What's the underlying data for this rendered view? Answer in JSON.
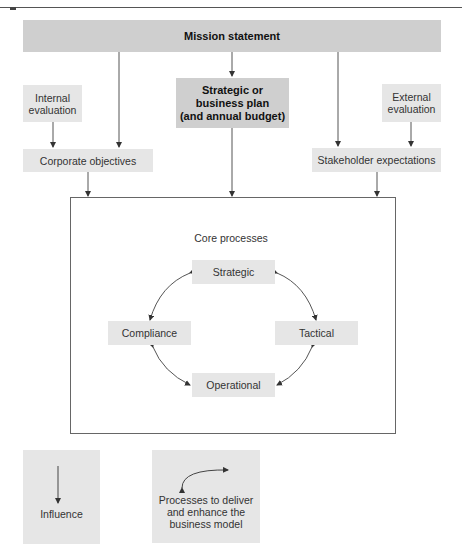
{
  "diagram": {
    "type": "flow diagram",
    "top_node": {
      "label": "Mission statement"
    },
    "plan_node": {
      "lines": [
        "Strategic or",
        "business plan",
        "(and annual budget)"
      ]
    },
    "internal_eval": {
      "lines": [
        "Internal",
        "evaluation"
      ]
    },
    "external_eval": {
      "lines": [
        "External",
        "evaluation"
      ]
    },
    "corporate_objectives": {
      "label": "Corporate objectives"
    },
    "stakeholder_expectations": {
      "label": "Stakeholder expectations"
    },
    "core": {
      "title": "Core processes",
      "nodes": [
        {
          "id": "strategic",
          "label": "Strategic"
        },
        {
          "id": "tactical",
          "label": "Tactical"
        },
        {
          "id": "operational",
          "label": "Operational"
        },
        {
          "id": "compliance",
          "label": "Compliance"
        }
      ]
    },
    "legend": {
      "influence": {
        "label": "Influence",
        "icon": "arrow-down-icon"
      },
      "process": {
        "lines": [
          "Processes to deliver",
          "and enhance the",
          "business model"
        ],
        "icon": "curved-arrow-icon"
      }
    },
    "edges": [
      {
        "from": "Mission statement",
        "to": "Strategic or business plan",
        "kind": "influence"
      },
      {
        "from": "Mission statement",
        "to": "Corporate objectives",
        "kind": "influence"
      },
      {
        "from": "Mission statement",
        "to": "Stakeholder expectations",
        "kind": "influence"
      },
      {
        "from": "Internal evaluation",
        "to": "Corporate objectives",
        "kind": "influence"
      },
      {
        "from": "External evaluation",
        "to": "Stakeholder expectations",
        "kind": "influence"
      },
      {
        "from": "Corporate objectives",
        "to": "Core processes",
        "kind": "influence"
      },
      {
        "from": "Strategic or business plan",
        "to": "Core processes",
        "kind": "influence"
      },
      {
        "from": "Stakeholder expectations",
        "to": "Core processes",
        "kind": "influence"
      },
      {
        "from": "Strategic",
        "to": "Tactical",
        "kind": "process"
      },
      {
        "from": "Tactical",
        "to": "Operational",
        "kind": "process"
      },
      {
        "from": "Operational",
        "to": "Compliance",
        "kind": "process"
      },
      {
        "from": "Compliance",
        "to": "Strategic",
        "kind": "process"
      }
    ],
    "colors": {
      "box_light": "#e6e6e6",
      "box_dark": "#cfcfcf",
      "line": "#444444"
    }
  }
}
